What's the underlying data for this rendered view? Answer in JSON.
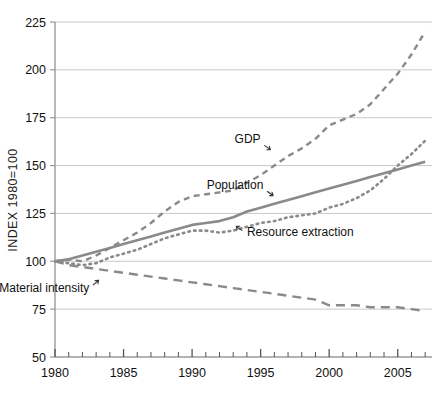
{
  "chart_data": {
    "type": "line",
    "title": "",
    "subtitle": "",
    "xlabel": "",
    "ylabel": "INDEX 1980=100",
    "xlim": [
      1980,
      2007.5
    ],
    "ylim": [
      50,
      225
    ],
    "ytick_labels": [
      "225",
      "200",
      "175",
      "150",
      "125",
      "100",
      "75",
      "50"
    ],
    "ytick_values": [
      225,
      200,
      175,
      150,
      125,
      100,
      75,
      50
    ],
    "xtick_labels": [
      "1980",
      "1985",
      "1990",
      "1995",
      "2000",
      "2005"
    ],
    "xtick_values": [
      1980,
      1985,
      1990,
      1995,
      2000,
      2005
    ],
    "minor_xtick_step": 1,
    "grid": "horizontal",
    "legend_position": "inline-annotations",
    "x": [
      1980,
      1981,
      1982,
      1983,
      1984,
      1985,
      1986,
      1987,
      1988,
      1989,
      1990,
      1991,
      1992,
      1993,
      1994,
      1995,
      1996,
      1997,
      1998,
      1999,
      2000,
      2001,
      2002,
      2003,
      2004,
      2005,
      2006,
      2007
    ],
    "series": [
      {
        "name": "GDP",
        "style": "dashed",
        "color": "#8a8a8a",
        "values": [
          100,
          101,
          100,
          103,
          107,
          111,
          115,
          120,
          126,
          131,
          134,
          135,
          136,
          137,
          141,
          145,
          150,
          155,
          159,
          164,
          171,
          174,
          177,
          182,
          190,
          198,
          208,
          220
        ]
      },
      {
        "name": "Population",
        "style": "solid",
        "color": "#8a8a8a",
        "values": [
          100,
          101,
          103,
          105,
          107,
          109,
          111,
          113,
          115,
          117,
          119,
          120,
          121,
          123,
          126,
          128,
          130,
          132,
          134,
          136,
          138,
          140,
          142,
          144,
          146,
          148,
          150,
          152
        ]
      },
      {
        "name": "Resource extraction",
        "style": "dotted",
        "color": "#8a8a8a",
        "values": [
          100,
          99,
          98,
          99,
          102,
          104,
          106,
          109,
          112,
          114,
          116,
          116,
          115,
          116,
          118,
          120,
          121,
          123,
          124,
          125,
          128,
          130,
          133,
          137,
          143,
          150,
          156,
          163
        ]
      },
      {
        "name": "Material intensity",
        "style": "dashed-long",
        "color": "#8a8a8a",
        "values": [
          100,
          98,
          97,
          96,
          95,
          94,
          93,
          92,
          91,
          90,
          89,
          88,
          87,
          86,
          85,
          84,
          83,
          82,
          81,
          80,
          77,
          77,
          77,
          76,
          76,
          76,
          75,
          74
        ]
      }
    ],
    "annotations": [
      {
        "text": "GDP",
        "x": 1995.0,
        "y": 162,
        "arrow": "down-right"
      },
      {
        "text": "Population",
        "x": 1995.2,
        "y": 138,
        "arrow": "down-right"
      },
      {
        "text": "Resource extraction",
        "x": 1994.0,
        "y": 113,
        "arrow": "up-left"
      },
      {
        "text": "Material intensity",
        "x": 1982.5,
        "y": 84,
        "arrow": "up-right"
      }
    ]
  },
  "colors": {
    "line": "#8a8a8a",
    "grid": "#c9c9c9",
    "axis": "#9a9a9a",
    "text": "#111111"
  }
}
